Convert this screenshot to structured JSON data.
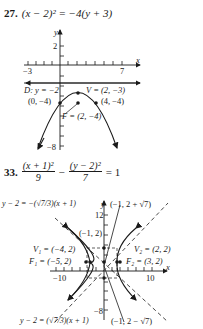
{
  "problem27": {
    "number": "27.",
    "equation": "(x − 2)² = −4(y + 3)",
    "axes": {
      "x_label": "x",
      "y_label": "y",
      "x_min_tick": "−3",
      "x_max_tick": "7",
      "y_top_tick": "2",
      "y_bottom_tick": "−8"
    },
    "labels": {
      "directrix": "D: y = −2",
      "vertex": "V = (2, −3)",
      "left_point": "(0, −4)",
      "right_point": "(4, −4)",
      "focus": "F = (2, −4)"
    }
  },
  "problem33": {
    "number": "33.",
    "equation": {
      "term1_num": "(x + 1)²",
      "term1_den": "9",
      "minus": "−",
      "term2_num": "(y − 2)²",
      "term2_den": "7",
      "rhs": "= 1"
    },
    "axes": {
      "x_label": "x",
      "y_label": "y",
      "x_min_tick": "−10",
      "x_max_tick": "10",
      "y_top_tick": "12",
      "y_bottom_tick": "−8"
    },
    "labels": {
      "asymptote_top": "y − 2 = −(√7/3)(x + 1)",
      "asymptote_bottom": "y − 2 = (√7/3)(x + 1)",
      "top_point": "(−1, 2 + √7)",
      "bottom_point": "(−1, 2 − √7)",
      "center": "(−1, 2)",
      "v1": "V₁ = (−4, 2)",
      "v2": "V₂ = (2, 2)",
      "f1": "F₁ = (−5, 2)",
      "f2": "F₂ = (3, 2)"
    }
  }
}
